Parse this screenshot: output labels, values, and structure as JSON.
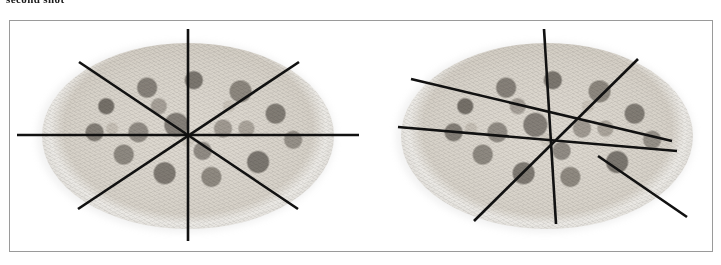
{
  "caption": "second shot",
  "figure": {
    "border_color": "#9a9a9a",
    "background_color": "#ffffff",
    "line_color": "#111111"
  },
  "panels": [
    {
      "name": "left-pizza",
      "label": "pizza cut into 8 equal slices",
      "slices": 8,
      "equal_slices": true,
      "center": {
        "x": 178,
        "y": 113
      },
      "pizza": {
        "cx": 178,
        "cy": 115,
        "rx": 146,
        "ry": 93
      },
      "cuts": [
        {
          "name": "vertical-cut",
          "x1": 178,
          "y1": 8,
          "x2": 178,
          "y2": 220
        },
        {
          "name": "horizontal-cut",
          "x1": 7,
          "y1": 114,
          "x2": 349,
          "y2": 114
        },
        {
          "name": "diagonal-nw-se-cut",
          "x1": 69,
          "y1": 41,
          "x2": 288,
          "y2": 188
        },
        {
          "name": "diagonal-ne-sw-cut",
          "x1": 289,
          "y1": 41,
          "x2": 68,
          "y2": 188
        }
      ]
    },
    {
      "name": "right-pizza",
      "label": "pizza cut into 8 unequal slices",
      "slices": 8,
      "equal_slices": false,
      "center": {
        "x": 185,
        "y": 110
      },
      "pizza": {
        "cx": 185,
        "cy": 115,
        "rx": 146,
        "ry": 93
      },
      "cuts": [
        {
          "name": "steep-vertical-cut",
          "x1": 182,
          "y1": 8,
          "x2": 194,
          "y2": 203
        },
        {
          "name": "shallow-left-cut",
          "x1": 36,
          "y1": 106,
          "x2": 315,
          "y2": 130
        },
        {
          "name": "upper-left-slant-cut",
          "x1": 49,
          "y1": 58,
          "x2": 310,
          "y2": 120
        },
        {
          "name": "upper-right-slant-cut",
          "x1": 276,
          "y1": 38,
          "x2": 112,
          "y2": 200
        },
        {
          "name": "lower-right-slant-cut",
          "x1": 236,
          "y1": 135,
          "x2": 325,
          "y2": 196
        }
      ]
    }
  ]
}
